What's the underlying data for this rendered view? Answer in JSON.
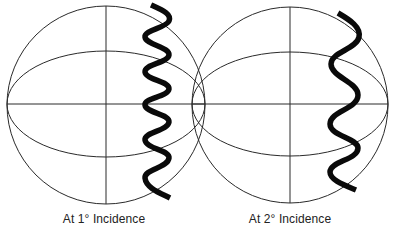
{
  "figure": {
    "panels": [
      {
        "id": "sphere-1",
        "label": "At 1° Incidence",
        "sphere": {
          "cx": 106,
          "cy": 105,
          "r": 99
        },
        "equator_ellipse": {
          "rx": 99,
          "ry": 53
        },
        "wave": {
          "description": "tightly coiled helix",
          "points": [
            [
              151,
              5
            ],
            [
              169,
              20
            ],
            [
              145,
              37
            ],
            [
              169,
              55
            ],
            [
              145,
              72
            ],
            [
              169,
              88
            ],
            [
              145,
              105
            ],
            [
              169,
              122
            ],
            [
              145,
              140
            ],
            [
              169,
              158
            ],
            [
              145,
              178
            ],
            [
              170,
              198
            ]
          ]
        }
      },
      {
        "id": "sphere-2",
        "label": "At 2° Incidence",
        "sphere": {
          "cx": 290,
          "cy": 105,
          "r": 98
        },
        "equator_ellipse": {
          "rx": 98,
          "ry": 52
        },
        "wave": {
          "description": "loosely coiled helix",
          "points": [
            [
              338,
              13
            ],
            [
              359,
              36
            ],
            [
              331,
              64
            ],
            [
              358,
              95
            ],
            [
              330,
              124
            ],
            [
              358,
              148
            ],
            [
              330,
              172
            ],
            [
              356,
              190
            ]
          ]
        }
      }
    ],
    "colors": {
      "line": "#2a2a2a",
      "wave": "#0a0a0a",
      "text": "#222222",
      "background": "#ffffff"
    }
  }
}
